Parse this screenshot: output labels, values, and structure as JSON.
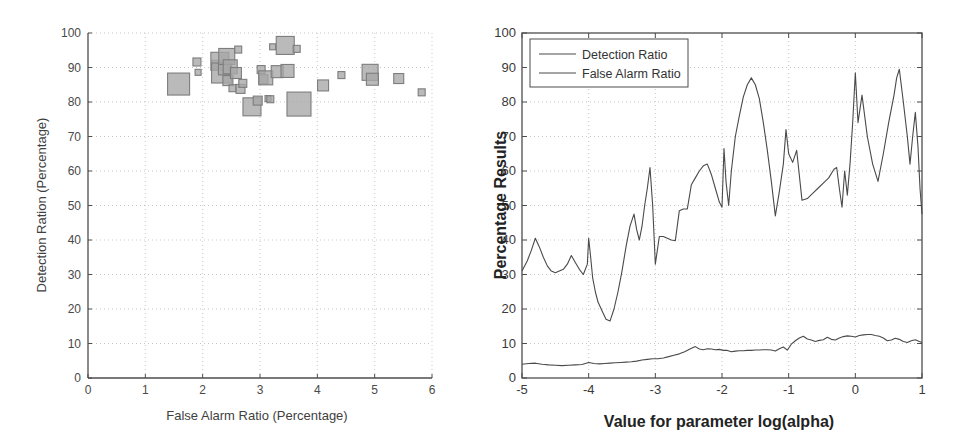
{
  "figure": {
    "background": "#ffffff",
    "axis_color": "#4d4d4d",
    "grid_color": "#b9b9b9",
    "marker_fill": "#a6a6a6",
    "marker_stroke": "#7d7d7d",
    "line_color": "#4a4a4a"
  },
  "left_panel": {
    "name": "scatter-panel",
    "xlabel": "False Alarm Ratio (Percentage)",
    "ylabel": "Detection Ration (Percentage)",
    "xticks": [
      "0",
      "1",
      "2",
      "3",
      "4",
      "5",
      "6"
    ],
    "yticks": [
      "0",
      "10",
      "20",
      "30",
      "40",
      "50",
      "60",
      "70",
      "80",
      "90",
      "100"
    ]
  },
  "right_panel": {
    "name": "line-panel",
    "xlabel": "Value for parameter log(alpha)",
    "ylabel": "Percentage Results",
    "xticks": [
      "-5",
      "-4",
      "-3",
      "-2",
      "-1",
      "0",
      "1"
    ],
    "yticks": [
      "0",
      "10",
      "20",
      "30",
      "40",
      "50",
      "60",
      "70",
      "80",
      "90",
      "100"
    ],
    "legend": [
      {
        "label": "Detection Ratio",
        "color": "#4a4a4a"
      },
      {
        "label": "False Alarm Ratio",
        "color": "#4a4a4a"
      }
    ]
  },
  "chart_data": [
    {
      "type": "scatter",
      "id": "scatter-false-alarm-vs-detection",
      "title": "",
      "xlabel": "False Alarm Ratio (Percentage)",
      "ylabel": "Detection Ration (Percentage)",
      "xlim": [
        0,
        6
      ],
      "ylim": [
        0,
        100
      ],
      "xticks": [
        0,
        1,
        2,
        3,
        4,
        5,
        6
      ],
      "yticks": [
        0,
        10,
        20,
        30,
        40,
        50,
        60,
        70,
        80,
        90,
        100
      ],
      "grid": true,
      "legend": null,
      "marker": "square",
      "note": "Bubble/square sizes vary per point (size encodes a third variable)",
      "points": [
        {
          "x": 1.58,
          "y": 85.2,
          "size": 22
        },
        {
          "x": 1.9,
          "y": 91.6,
          "size": 8
        },
        {
          "x": 1.92,
          "y": 88.6,
          "size": 6
        },
        {
          "x": 2.24,
          "y": 90.8,
          "size": 9
        },
        {
          "x": 2.3,
          "y": 91.8,
          "size": 18
        },
        {
          "x": 2.33,
          "y": 88.4,
          "size": 20
        },
        {
          "x": 2.38,
          "y": 89.6,
          "size": 12
        },
        {
          "x": 2.42,
          "y": 93.2,
          "size": 16
        },
        {
          "x": 2.44,
          "y": 86.2,
          "size": 10
        },
        {
          "x": 2.48,
          "y": 90.2,
          "size": 14
        },
        {
          "x": 2.52,
          "y": 84.0,
          "size": 7
        },
        {
          "x": 2.58,
          "y": 88.4,
          "size": 11
        },
        {
          "x": 2.62,
          "y": 95.2,
          "size": 7
        },
        {
          "x": 2.66,
          "y": 83.8,
          "size": 9
        },
        {
          "x": 2.7,
          "y": 85.4,
          "size": 8
        },
        {
          "x": 2.86,
          "y": 78.6,
          "size": 18
        },
        {
          "x": 2.96,
          "y": 80.4,
          "size": 9
        },
        {
          "x": 3.02,
          "y": 89.4,
          "size": 8
        },
        {
          "x": 3.06,
          "y": 86.6,
          "size": 9
        },
        {
          "x": 3.1,
          "y": 87.0,
          "size": 14
        },
        {
          "x": 3.14,
          "y": 81.0,
          "size": 6
        },
        {
          "x": 3.18,
          "y": 80.8,
          "size": 7
        },
        {
          "x": 3.22,
          "y": 96.0,
          "size": 6
        },
        {
          "x": 3.3,
          "y": 88.8,
          "size": 12
        },
        {
          "x": 3.44,
          "y": 96.4,
          "size": 18
        },
        {
          "x": 3.48,
          "y": 89.0,
          "size": 13
        },
        {
          "x": 3.64,
          "y": 95.4,
          "size": 7
        },
        {
          "x": 3.68,
          "y": 79.4,
          "size": 24
        },
        {
          "x": 4.1,
          "y": 84.8,
          "size": 11
        },
        {
          "x": 4.42,
          "y": 87.8,
          "size": 7
        },
        {
          "x": 4.92,
          "y": 88.6,
          "size": 16
        },
        {
          "x": 4.96,
          "y": 86.6,
          "size": 12
        },
        {
          "x": 5.42,
          "y": 86.8,
          "size": 10
        },
        {
          "x": 5.82,
          "y": 82.8,
          "size": 7
        }
      ]
    },
    {
      "type": "line",
      "id": "ratios-vs-log-alpha",
      "title": "",
      "xlabel": "Value for parameter log(alpha)",
      "ylabel": "Percentage Results",
      "xlim": [
        -5,
        1
      ],
      "ylim": [
        0,
        100
      ],
      "xticks": [
        -5,
        -4,
        -3,
        -2,
        -1,
        0,
        1
      ],
      "yticks": [
        0,
        10,
        20,
        30,
        40,
        50,
        60,
        70,
        80,
        90,
        100
      ],
      "grid": true,
      "legend_position": "upper-left",
      "series": [
        {
          "name": "Detection Ratio",
          "color": "#4a4a4a",
          "x": [
            -5.0,
            -4.92,
            -4.86,
            -4.8,
            -4.74,
            -4.68,
            -4.62,
            -4.56,
            -4.5,
            -4.44,
            -4.38,
            -4.32,
            -4.26,
            -4.2,
            -4.14,
            -4.08,
            -4.02,
            -4.0,
            -3.97,
            -3.94,
            -3.9,
            -3.86,
            -3.8,
            -3.74,
            -3.68,
            -3.62,
            -3.56,
            -3.5,
            -3.44,
            -3.38,
            -3.32,
            -3.28,
            -3.24,
            -3.2,
            -3.16,
            -3.12,
            -3.08,
            -3.04,
            -3.0,
            -2.94,
            -2.88,
            -2.82,
            -2.76,
            -2.7,
            -2.64,
            -2.58,
            -2.52,
            -2.46,
            -2.4,
            -2.34,
            -2.28,
            -2.22,
            -2.16,
            -2.1,
            -2.04,
            -2.0,
            -1.97,
            -1.94,
            -1.9,
            -1.86,
            -1.8,
            -1.74,
            -1.68,
            -1.62,
            -1.56,
            -1.5,
            -1.44,
            -1.38,
            -1.32,
            -1.26,
            -1.2,
            -1.14,
            -1.08,
            -1.04,
            -1.0,
            -0.94,
            -0.88,
            -0.8,
            -0.72,
            -0.64,
            -0.56,
            -0.48,
            -0.4,
            -0.32,
            -0.28,
            -0.24,
            -0.2,
            -0.16,
            -0.12,
            -0.08,
            -0.04,
            0.0,
            0.04,
            0.1,
            0.18,
            0.26,
            0.34,
            0.42,
            0.5,
            0.58,
            0.62,
            0.66,
            0.72,
            0.78,
            0.82,
            0.86,
            0.9,
            0.94,
            0.97,
            1.0
          ],
          "y": [
            31.0,
            34.0,
            37.0,
            40.5,
            38.0,
            35.0,
            32.5,
            31.0,
            30.5,
            31.0,
            31.5,
            33.0,
            35.5,
            33.5,
            31.5,
            30.0,
            33.0,
            40.5,
            35.0,
            29.0,
            25.0,
            22.0,
            19.5,
            17.0,
            16.5,
            20.0,
            25.0,
            31.0,
            38.0,
            44.0,
            47.5,
            43.0,
            40.0,
            44.0,
            50.0,
            55.0,
            61.0,
            50.0,
            33.0,
            41.0,
            41.0,
            40.5,
            40.0,
            39.8,
            48.5,
            49.0,
            49.0,
            56.0,
            58.0,
            60.0,
            61.5,
            62.0,
            59.0,
            55.0,
            51.0,
            49.5,
            66.5,
            57.0,
            50.0,
            60.0,
            70.0,
            76.0,
            81.5,
            85.0,
            87.0,
            85.0,
            81.0,
            74.0,
            66.0,
            57.0,
            47.0,
            54.0,
            62.0,
            72.0,
            65.0,
            62.5,
            66.0,
            51.5,
            52.0,
            53.5,
            55.0,
            56.5,
            58.0,
            60.5,
            61.0,
            55.0,
            49.5,
            60.0,
            53.0,
            62.0,
            74.0,
            88.5,
            74.0,
            82.0,
            70.0,
            62.0,
            57.0,
            65.0,
            74.0,
            82.0,
            87.0,
            89.5,
            80.0,
            70.0,
            62.0,
            70.0,
            77.0,
            67.0,
            55.0,
            47.5,
            62.0,
            79.5
          ]
        },
        {
          "name": "False Alarm Ratio",
          "color": "#4a4a4a",
          "x": [
            -5.0,
            -4.9,
            -4.8,
            -4.7,
            -4.6,
            -4.5,
            -4.4,
            -4.3,
            -4.2,
            -4.1,
            -4.0,
            -3.92,
            -3.84,
            -3.76,
            -3.68,
            -3.6,
            -3.52,
            -3.44,
            -3.36,
            -3.28,
            -3.2,
            -3.12,
            -3.04,
            -2.96,
            -2.88,
            -2.8,
            -2.72,
            -2.64,
            -2.56,
            -2.48,
            -2.4,
            -2.34,
            -2.28,
            -2.22,
            -2.16,
            -2.1,
            -2.04,
            -1.98,
            -1.92,
            -1.86,
            -1.8,
            -1.74,
            -1.68,
            -1.62,
            -1.56,
            -1.5,
            -1.44,
            -1.38,
            -1.32,
            -1.26,
            -1.2,
            -1.14,
            -1.08,
            -1.02,
            -0.96,
            -0.9,
            -0.84,
            -0.78,
            -0.72,
            -0.66,
            -0.6,
            -0.54,
            -0.48,
            -0.42,
            -0.36,
            -0.3,
            -0.24,
            -0.18,
            -0.12,
            -0.06,
            0.0,
            0.06,
            0.12,
            0.18,
            0.24,
            0.3,
            0.36,
            0.42,
            0.48,
            0.54,
            0.6,
            0.66,
            0.72,
            0.78,
            0.84,
            0.9,
            0.96,
            1.0
          ],
          "y": [
            4.0,
            4.2,
            4.3,
            4.0,
            3.8,
            3.7,
            3.6,
            3.7,
            3.8,
            3.9,
            4.5,
            4.2,
            4.1,
            4.2,
            4.3,
            4.4,
            4.5,
            4.6,
            4.7,
            4.9,
            5.2,
            5.4,
            5.6,
            5.6,
            5.8,
            6.2,
            6.6,
            7.0,
            7.6,
            8.4,
            9.1,
            8.4,
            8.2,
            8.5,
            8.4,
            8.2,
            8.3,
            8.0,
            8.0,
            7.6,
            7.8,
            7.9,
            7.9,
            8.0,
            8.0,
            8.1,
            8.1,
            8.2,
            8.2,
            8.1,
            7.8,
            8.5,
            9.0,
            8.1,
            9.8,
            10.8,
            11.6,
            12.1,
            11.3,
            11.0,
            10.6,
            10.9,
            11.1,
            11.8,
            11.2,
            11.0,
            11.6,
            12.0,
            12.2,
            12.1,
            11.9,
            12.3,
            12.5,
            12.6,
            12.6,
            12.3,
            12.1,
            11.6,
            10.8,
            11.0,
            11.5,
            11.2,
            10.6,
            10.3,
            10.8,
            11.1,
            10.6,
            10.3,
            12.5
          ]
        }
      ]
    }
  ]
}
